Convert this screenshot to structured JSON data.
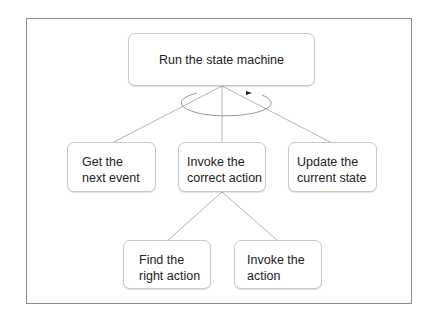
{
  "diagram": {
    "type": "tree",
    "root": {
      "id": "root",
      "label": "Run the state machine",
      "loop_indicator": "ellipse-arrow"
    },
    "level1": [
      {
        "id": "get-event",
        "label": "Get the\nnext event"
      },
      {
        "id": "invoke-correct",
        "label": "Invoke the\ncorrect action"
      },
      {
        "id": "update-state",
        "label": "Update the\ncurrent state"
      }
    ],
    "level2": [
      {
        "id": "find-action",
        "label": "Find the\nright action",
        "parent": "invoke-correct"
      },
      {
        "id": "invoke-action",
        "label": "Invoke the\naction",
        "parent": "invoke-correct"
      }
    ],
    "colors": {
      "line": "#b4b4b4",
      "border": "#c8c8c8",
      "frame": "#8c8c8c",
      "text": "#222222"
    }
  }
}
